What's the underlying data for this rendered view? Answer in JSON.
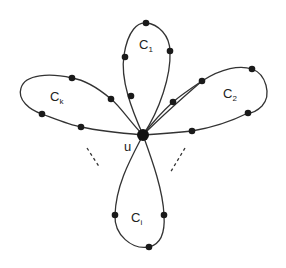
{
  "diagram": {
    "type": "flower graph / union of cycles sharing a vertex",
    "center_vertex": {
      "label": "u",
      "x": 143,
      "y": 135
    },
    "cycles": [
      {
        "id": "C1",
        "label": "C",
        "subscript": "1",
        "position": "top",
        "vertices": [
          [
            146,
            23
          ],
          [
            125,
            57
          ],
          [
            170,
            51
          ],
          [
            131,
            96
          ],
          [
            173,
            102
          ]
        ]
      },
      {
        "id": "C2",
        "label": "C",
        "subscript": "2",
        "position": "right",
        "vertices": [
          [
            202,
            81
          ],
          [
            252,
            69
          ],
          [
            248,
            113
          ],
          [
            192,
            131
          ]
        ]
      },
      {
        "id": "Ci",
        "label": "C",
        "subscript": "i",
        "position": "bottom",
        "vertices": [
          [
            115,
            215
          ],
          [
            164,
            215
          ],
          [
            149,
            247
          ]
        ]
      },
      {
        "id": "Ck",
        "label": "C",
        "subscript": "k",
        "position": "left",
        "vertices": [
          [
            72,
            78
          ],
          [
            111,
            99
          ],
          [
            42,
            114
          ],
          [
            81,
            127
          ]
        ]
      }
    ],
    "ellipsis_marks": [
      {
        "side": "lower-left",
        "from": [
          87,
          148
        ],
        "to": [
          100,
          168
        ]
      },
      {
        "side": "lower-right",
        "from": [
          185,
          148
        ],
        "to": [
          170,
          173
        ]
      }
    ],
    "colors": {
      "stroke": "#333333",
      "vertex": "#1a1a1a",
      "background": "#ffffff"
    }
  }
}
